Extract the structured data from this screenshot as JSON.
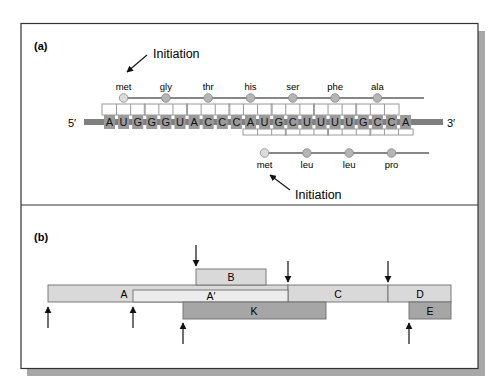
{
  "panel_a": {
    "label": "(a)",
    "five_prime": "5′",
    "three_prime": "3′",
    "initiation_top": "Initiation",
    "initiation_bottom": "Initiation",
    "sequence": [
      "A",
      "U",
      "G",
      "G",
      "G",
      "U",
      "A",
      "C",
      "C",
      "C",
      "A",
      "U",
      "G",
      "C",
      "U",
      "U",
      "U",
      "U",
      "G",
      "C",
      "C",
      "A"
    ],
    "frame_top": {
      "start_index": 0,
      "amino_acids": [
        "met",
        "gly",
        "thr",
        "his",
        "ser",
        "phe",
        "ala"
      ]
    },
    "frame_bottom": {
      "start_index": 10,
      "amino_acids": [
        "met",
        "leu",
        "leu",
        "pro"
      ]
    }
  },
  "panel_b": {
    "label": "(b)",
    "genes": [
      {
        "name": "A",
        "label": "A",
        "x1": 48,
        "x2": 288,
        "y": 285,
        "h": 17,
        "fill": "#d9d9d9",
        "label_x": 124
      },
      {
        "name": "A-prime",
        "label": "A′",
        "x1": 133,
        "x2": 288,
        "y": 290,
        "h": 12,
        "fill": "#ececec",
        "label_x": 211
      },
      {
        "name": "B",
        "label": "B",
        "x1": 196,
        "x2": 266,
        "y": 269,
        "h": 16,
        "fill": "#d9d9d9",
        "label_x": 231
      },
      {
        "name": "C",
        "label": "C",
        "x1": 288,
        "x2": 388,
        "y": 285,
        "h": 17,
        "fill": "#d9d9d9",
        "label_x": 338
      },
      {
        "name": "D",
        "label": "D",
        "x1": 388,
        "x2": 451,
        "y": 285,
        "h": 17,
        "fill": "#d9d9d9",
        "label_x": 420
      },
      {
        "name": "K",
        "label": "K",
        "x1": 183,
        "x2": 326,
        "y": 302,
        "h": 17,
        "fill": "#a6a6a6",
        "label_x": 254
      },
      {
        "name": "E",
        "label": "E",
        "x1": 409,
        "x2": 451,
        "y": 302,
        "h": 17,
        "fill": "#a6a6a6",
        "label_x": 430
      }
    ],
    "down_arrows": [
      {
        "x": 196,
        "y1": 245,
        "y2": 266
      },
      {
        "x": 288,
        "y1": 261,
        "y2": 282
      },
      {
        "x": 388,
        "y1": 261,
        "y2": 282
      }
    ],
    "up_arrows": [
      {
        "x": 48,
        "y1": 328,
        "y2": 307
      },
      {
        "x": 133,
        "y1": 328,
        "y2": 307
      },
      {
        "x": 183,
        "y1": 344,
        "y2": 323
      },
      {
        "x": 409,
        "y1": 344,
        "y2": 323
      }
    ]
  },
  "colors": {
    "frame": "#333333",
    "shadow": "#a8a8a8",
    "mrna_bar": "#7f7f7f",
    "base_box": "#9a9a9a",
    "bracket": "#9a9a9a",
    "aa_circle": "#b5b5b5",
    "met_circle": "#dcdcdc"
  }
}
